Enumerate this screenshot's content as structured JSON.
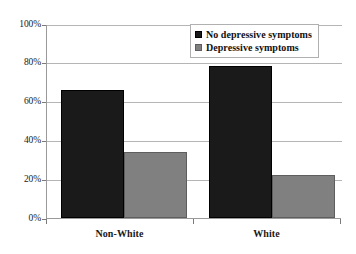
{
  "chart_data": {
    "type": "bar",
    "title": "",
    "subtitle": "",
    "xlabel": "",
    "ylabel": "",
    "categories": [
      "Non-White",
      "White"
    ],
    "series": [
      {
        "name": "No depressive symptoms",
        "color": "#1a1a1a",
        "values": [
          66.5,
          79.0
        ]
      },
      {
        "name": "Depressive symptoms",
        "color": "#808080",
        "values": [
          34.0,
          22.5
        ]
      }
    ],
    "ylim": [
      0,
      100
    ],
    "y_ticks": [
      0,
      20,
      40,
      60,
      80,
      100
    ],
    "y_tick_labels": [
      "0%",
      "20%",
      "40%",
      "60%",
      "80%",
      "100%"
    ],
    "grid": true,
    "grid_axis": "y",
    "legend_position": "top-right",
    "legend_entries": [
      "No depressive symptoms",
      "Depressive symptoms"
    ]
  },
  "axes": {
    "y_tick_labels": [
      "100%",
      "80%",
      "60%",
      "40%",
      "20%",
      "0%"
    ],
    "x_tick_labels": [
      "Non-White",
      "White"
    ]
  },
  "legend": {
    "items": [
      {
        "label": "No depressive symptoms"
      },
      {
        "label": "Depressive symptoms"
      }
    ]
  }
}
